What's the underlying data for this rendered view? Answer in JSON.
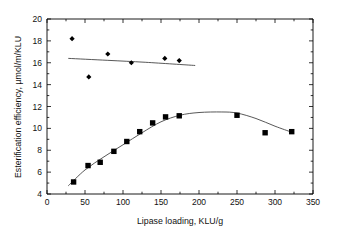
{
  "chart_data": {
    "type": "scatter",
    "title": "",
    "xlabel": "Lipase loading, KLU/g",
    "ylabel": "Esterification efficiency, µmol/m/KLU",
    "xlim": [
      0,
      350
    ],
    "ylim": [
      4,
      20
    ],
    "xticks": [
      0,
      50,
      100,
      150,
      200,
      250,
      300,
      350
    ],
    "yticks": [
      4,
      6,
      8,
      10,
      12,
      14,
      16,
      18,
      20
    ],
    "xtick_labels": [
      "0",
      "50",
      "100",
      "150",
      "200",
      "250",
      "300",
      "350"
    ],
    "ytick_labels": [
      "4",
      "6",
      "8",
      "10",
      "12",
      "14",
      "16",
      "18",
      "20"
    ],
    "grid": false,
    "legend": "none",
    "minor_ticks": true,
    "series": [
      {
        "name": "Esterification efficiency per KLU",
        "marker": "diamond",
        "color": "#000000",
        "points": [
          {
            "x": 33,
            "y": 18.2
          },
          {
            "x": 55,
            "y": 14.7
          },
          {
            "x": 80,
            "y": 16.8
          },
          {
            "x": 111,
            "y": 16.0
          },
          {
            "x": 155,
            "y": 16.4
          },
          {
            "x": 174,
            "y": 16.2
          }
        ],
        "trend": [
          {
            "x": 28,
            "y": 16.4
          },
          {
            "x": 80,
            "y": 16.22
          },
          {
            "x": 130,
            "y": 16.04
          },
          {
            "x": 195,
            "y": 15.75
          }
        ]
      },
      {
        "name": "Esterification efficiency total",
        "marker": "square",
        "color": "#000000",
        "points": [
          {
            "x": 35,
            "y": 5.1
          },
          {
            "x": 54,
            "y": 6.6
          },
          {
            "x": 70,
            "y": 6.9
          },
          {
            "x": 88,
            "y": 7.9
          },
          {
            "x": 105,
            "y": 8.8
          },
          {
            "x": 122,
            "y": 9.7
          },
          {
            "x": 139,
            "y": 10.5
          },
          {
            "x": 156,
            "y": 11.05
          },
          {
            "x": 174,
            "y": 11.15
          },
          {
            "x": 250,
            "y": 11.2
          },
          {
            "x": 287,
            "y": 9.6
          },
          {
            "x": 322,
            "y": 9.7
          }
        ],
        "trend": [
          {
            "x": 28,
            "y": 4.75
          },
          {
            "x": 50,
            "y": 6.2
          },
          {
            "x": 75,
            "y": 7.4
          },
          {
            "x": 100,
            "y": 8.5
          },
          {
            "x": 125,
            "y": 9.6
          },
          {
            "x": 150,
            "y": 10.6
          },
          {
            "x": 175,
            "y": 11.2
          },
          {
            "x": 200,
            "y": 11.45
          },
          {
            "x": 230,
            "y": 11.5
          },
          {
            "x": 250,
            "y": 11.4
          },
          {
            "x": 275,
            "y": 10.9
          },
          {
            "x": 300,
            "y": 10.2
          },
          {
            "x": 322,
            "y": 9.65
          }
        ]
      }
    ]
  }
}
